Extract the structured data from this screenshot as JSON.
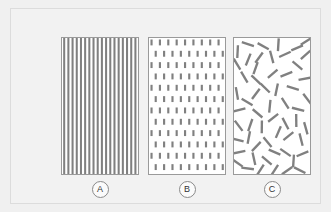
{
  "figure": {
    "background_color": "#f0f0f0",
    "frame_color": "#dcdcdc",
    "panel_background": "#ffffff",
    "panel_border_color": "#9a9a9a",
    "mark_color": "#808080"
  },
  "panels": [
    {
      "id": "A",
      "label": "A",
      "pattern": "aligned-vertical-stripes",
      "mark_color": "#808080",
      "stripe_period": 4.3,
      "stripe_width": 2.1,
      "stripe_count": 18
    },
    {
      "id": "B",
      "label": "B",
      "pattern": "aligned-short-dashes-offset-grid",
      "mark_color": "#808080",
      "dash_width": 2.2,
      "dash_height": 6,
      "column_spacing": 8.6,
      "row_spacing": 11.5
    },
    {
      "id": "C",
      "label": "C",
      "pattern": "randomly-oriented-segments",
      "mark_color": "#808080",
      "segment_length": 13,
      "segment_width": 2.4,
      "segment_count": 64
    }
  ],
  "chart_data": {
    "type": "scatter",
    "title": "",
    "xlabel": "",
    "ylabel": "",
    "series": [
      {
        "name": "A",
        "pattern": "aligned-vertical-stripes",
        "orientation_deg": 90,
        "orientation_spread_deg": 0,
        "count": 18
      },
      {
        "name": "B",
        "pattern": "aligned-short-dashes",
        "orientation_deg": 90,
        "orientation_spread_deg": 0,
        "count": 168
      },
      {
        "name": "C",
        "pattern": "random-short-segments",
        "orientation_deg": 0,
        "orientation_spread_deg": 180,
        "count": 64
      }
    ]
  }
}
